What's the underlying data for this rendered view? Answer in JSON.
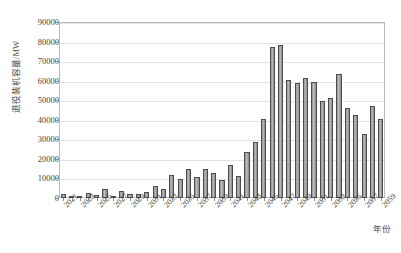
{
  "figure": {
    "top_caption": "",
    "background": "#ffffff",
    "bar_fill": "#9a9a9a",
    "bar_stroke": "#4d4d4d",
    "grid_color": "#e2e2e2",
    "frame_color": "#b9b9b9"
  },
  "chart_data": {
    "type": "bar",
    "title": "",
    "xlabel": "年份",
    "ylabel": "退役装机容量/MW",
    "ylim": [
      0,
      90000
    ],
    "ytick_labels": [
      "0",
      "10000",
      "20000",
      "30000",
      "40000",
      "50000",
      "60000",
      "70000",
      "80000",
      "90000"
    ],
    "ytick_values": [
      0,
      10000,
      20000,
      30000,
      40000,
      50000,
      60000,
      70000,
      80000,
      90000
    ],
    "grid": true,
    "legend": "none",
    "xtick_labels": [
      "2021",
      "2023",
      "2025",
      "2027",
      "2029",
      "2031",
      "2033",
      "2035",
      "2037",
      "2039",
      "2041",
      "2043",
      "2045",
      "2047",
      "2049",
      "2051",
      "2053",
      "2055",
      "2057",
      "2059"
    ],
    "xtick_label_rotation": -45,
    "categories": [
      "2021",
      "2022",
      "2023",
      "2024",
      "2025",
      "2026",
      "2027",
      "2028",
      "2029",
      "2030",
      "2031",
      "2032",
      "2033",
      "2034",
      "2035",
      "2036",
      "2037",
      "2038",
      "2039",
      "2040",
      "2041",
      "2042",
      "2043",
      "2044",
      "2045",
      "2046",
      "2047",
      "2048",
      "2049",
      "2050",
      "2051",
      "2052",
      "2053",
      "2054",
      "2055",
      "2056",
      "2057",
      "2058",
      "2059"
    ],
    "values": [
      2200,
      700,
      1100,
      2400,
      1500,
      4400,
      1200,
      3500,
      2100,
      2000,
      3300,
      6300,
      4700,
      11700,
      9600,
      14600,
      10500,
      15000,
      12900,
      9300,
      16800,
      11200,
      23600,
      28500,
      40200,
      77300,
      78300,
      60400,
      59000,
      61400,
      59300,
      49800,
      51200,
      63400,
      46000,
      42700,
      32800,
      47000,
      40600
    ]
  }
}
